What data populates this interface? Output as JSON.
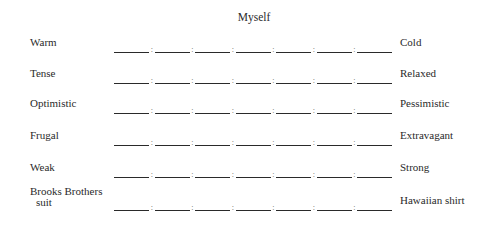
{
  "title": "Myself",
  "scale_points": 7,
  "separator": ":",
  "rows": [
    {
      "left": "Warm",
      "right": "Cold"
    },
    {
      "left": "Tense",
      "right": "Relaxed"
    },
    {
      "left": "Optimistic",
      "right": "Pessimistic"
    },
    {
      "left": "Frugal",
      "right": "Extravagant"
    },
    {
      "left": "Weak",
      "right": "Strong"
    },
    {
      "left_line1": "Brooks Brothers",
      "left_line2": "suit",
      "right": "Hawaiian shirt"
    }
  ]
}
